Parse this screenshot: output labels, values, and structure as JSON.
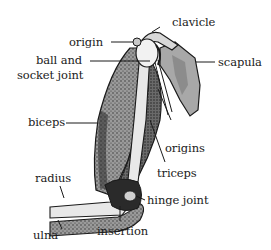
{
  "diagram": {
    "labels": {
      "clavicle": "clavicle",
      "origin": "origin",
      "ball_and_socket_line1": "ball and",
      "ball_and_socket_line2": "socket joint",
      "scapula": "scapula",
      "biceps": "biceps",
      "origins": "origins",
      "triceps": "triceps",
      "radius": "radius",
      "hinge_joint": "hinge joint",
      "ulna": "ulna",
      "insertion": "insertion"
    },
    "colors": {
      "outline": "#1a1a1a",
      "muscle_fill": "#8a8a8a",
      "muscle_dark": "#4a4a4a",
      "bone_fill": "#e6e6e6",
      "scapula_fill": "#9a9a9a",
      "background": "#ffffff"
    }
  }
}
